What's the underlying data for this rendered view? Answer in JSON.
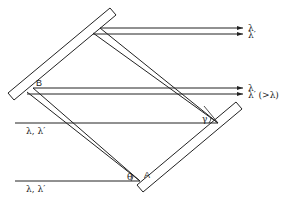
{
  "diagram": {
    "type": "optical double-grating ray diagram",
    "stroke_color": "#222222",
    "background": "#ffffff",
    "points": {
      "A": {
        "label": "A",
        "x": 140,
        "y": 181
      },
      "B": {
        "label": "B",
        "x": 32,
        "y": 90
      }
    },
    "angles": {
      "theta": {
        "label": "θ"
      },
      "gamma": {
        "label": "γ"
      }
    },
    "incident_beams": [
      {
        "label": "λ, λ′",
        "y": 123
      },
      {
        "label": "λ, λ′",
        "y": 181
      }
    ],
    "output_beams": [
      {
        "label": "λ",
        "y": 28
      },
      {
        "label": "λ′",
        "y": 34
      },
      {
        "label": "λ",
        "y": 88
      },
      {
        "label": "λ′ (>λ)",
        "y": 94
      }
    ]
  }
}
